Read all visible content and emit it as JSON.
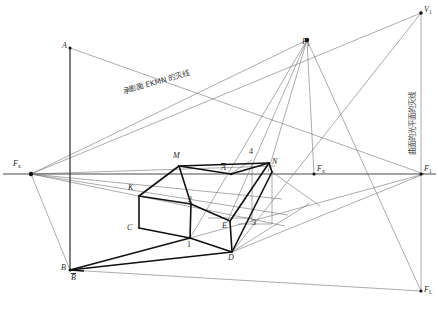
{
  "figure": {
    "type": "perspective-shadow-construction-diagram",
    "canvas": {
      "width": 438,
      "height": 313
    },
    "annotations": {
      "plane_vanishing_line": "承影面 EKMN 的灭线",
      "light_plane_vanishing_line": "曲面的光平面的灭线"
    },
    "points": [
      {
        "id": "A",
        "label": "A",
        "x": 70,
        "y": 48,
        "sub": "",
        "overbar": false
      },
      {
        "id": "B",
        "label": "B",
        "x": 70,
        "y": 270,
        "sub": "",
        "overbar": false
      },
      {
        "id": "Bbar",
        "label": "B",
        "x": 78,
        "y": 280,
        "sub": "",
        "overbar": true
      },
      {
        "id": "Fx",
        "label": "F",
        "x": 28,
        "y": 174,
        "sub": "x",
        "overbar": false
      },
      {
        "id": "F1",
        "label": "F",
        "x": 310,
        "y": 58,
        "sub": "1",
        "overbar": false
      },
      {
        "id": "V1",
        "label": "V",
        "x": 424,
        "y": 13,
        "sub": "1",
        "overbar": false
      },
      {
        "id": "Fx2",
        "label": "F",
        "x": 318,
        "y": 174,
        "sub": "x",
        "overbar": false
      },
      {
        "id": "F1b",
        "label": "F",
        "x": 424,
        "y": 174,
        "sub": "1",
        "overbar": false
      },
      {
        "id": "FL",
        "label": "F",
        "x": 424,
        "y": 295,
        "sub": "L",
        "overbar": false
      },
      {
        "id": "M",
        "label": "M",
        "x": 179,
        "y": 160,
        "sub": "",
        "overbar": false
      },
      {
        "id": "N",
        "label": "N",
        "x": 268,
        "y": 164,
        "sub": "",
        "overbar": false
      },
      {
        "id": "K",
        "label": "K",
        "x": 137,
        "y": 191,
        "sub": "",
        "overbar": false
      },
      {
        "id": "C",
        "label": "C",
        "x": 136,
        "y": 231,
        "sub": "",
        "overbar": false
      },
      {
        "id": "E",
        "label": "E",
        "x": 227,
        "y": 230,
        "sub": "",
        "overbar": false
      },
      {
        "id": "D",
        "label": "D",
        "x": 232,
        "y": 261,
        "sub": "",
        "overbar": false
      },
      {
        "id": "Abar",
        "label": "A",
        "x": 225,
        "y": 170,
        "sub": "",
        "overbar": true
      },
      {
        "id": "n1",
        "label": "1",
        "x": 190,
        "y": 246,
        "sub": "",
        "overbar": false
      },
      {
        "id": "n2",
        "label": "2",
        "x": 191,
        "y": 209,
        "sub": "",
        "overbar": false
      },
      {
        "id": "n3",
        "label": "3",
        "x": 255,
        "y": 227,
        "sub": "",
        "overbar": false
      },
      {
        "id": "n4",
        "label": "4",
        "x": 252,
        "y": 154,
        "sub": "",
        "overbar": false
      }
    ],
    "colors": {
      "line_thin": "#555555",
      "line_solid": "#1a1a1a",
      "horizon": "#444444",
      "text": "#2b2b2b",
      "annotation": "#3a3a3a"
    }
  }
}
